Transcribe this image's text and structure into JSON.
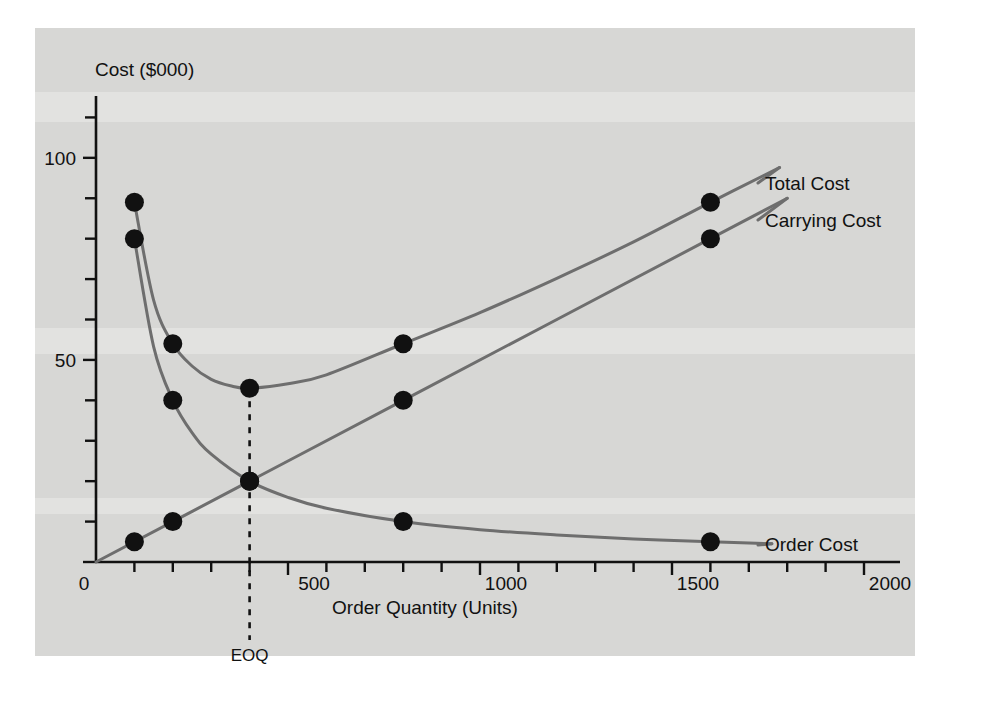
{
  "chart_data": {
    "type": "line",
    "title": "",
    "xlabel": "Order Quantity (Units)",
    "ylabel": "Cost ($000)",
    "xlim": [
      0,
      2000
    ],
    "ylim": [
      0,
      120
    ],
    "xticks": [
      0,
      100,
      200,
      300,
      400,
      500,
      600,
      700,
      800,
      900,
      1000,
      1100,
      1200,
      1300,
      1400,
      1500,
      1600,
      1700,
      1800,
      1900,
      2000
    ],
    "xtick_labels": [
      "0",
      "500",
      "1000",
      "1500",
      "2000"
    ],
    "xtick_label_values": [
      0,
      500,
      1000,
      1500,
      2000
    ],
    "yticks": [
      0,
      10,
      20,
      30,
      40,
      50,
      60,
      70,
      80,
      90,
      100,
      110
    ],
    "ytick_labels": [
      "0",
      "50",
      "100"
    ],
    "ytick_label_values": [
      0,
      50,
      100
    ],
    "grid": false,
    "legend_position": "right-of-curves",
    "annotations": [
      {
        "name": "eoq-marker",
        "label": "EOQ",
        "x": 400,
        "style": "dashed-vertical",
        "from_y": 0,
        "to_y": 43
      }
    ],
    "series": [
      {
        "name": "Total Cost",
        "label": "Total Cost",
        "color": "#6e6e6e",
        "marker": "filled-circle",
        "marker_points": [
          {
            "x": 100,
            "y": 89
          },
          {
            "x": 200,
            "y": 54
          },
          {
            "x": 400,
            "y": 43
          },
          {
            "x": 800,
            "y": 54
          },
          {
            "x": 1600,
            "y": 89
          }
        ],
        "curve": [
          {
            "x": 100,
            "y": 89
          },
          {
            "x": 150,
            "y": 64.8
          },
          {
            "x": 200,
            "y": 54
          },
          {
            "x": 250,
            "y": 48.5
          },
          {
            "x": 300,
            "y": 45.2
          },
          {
            "x": 350,
            "y": 43.6
          },
          {
            "x": 400,
            "y": 43
          },
          {
            "x": 500,
            "y": 44.1
          },
          {
            "x": 600,
            "y": 46.3
          },
          {
            "x": 800,
            "y": 54
          },
          {
            "x": 1000,
            "y": 61.7
          },
          {
            "x": 1200,
            "y": 70.2
          },
          {
            "x": 1400,
            "y": 79.2
          },
          {
            "x": 1600,
            "y": 89
          },
          {
            "x": 1780,
            "y": 97.6
          }
        ]
      },
      {
        "name": "Carrying Cost",
        "label": "Carrying Cost",
        "color": "#6e6e6e",
        "marker": "filled-circle",
        "marker_points": [
          {
            "x": 100,
            "y": 5
          },
          {
            "x": 200,
            "y": 10
          },
          {
            "x": 400,
            "y": 20
          },
          {
            "x": 800,
            "y": 40
          },
          {
            "x": 1600,
            "y": 80
          }
        ],
        "curve": [
          {
            "x": 0,
            "y": 0
          },
          {
            "x": 400,
            "y": 20
          },
          {
            "x": 800,
            "y": 40
          },
          {
            "x": 1600,
            "y": 80
          },
          {
            "x": 1800,
            "y": 90
          }
        ]
      },
      {
        "name": "Order Cost",
        "label": "Order Cost",
        "color": "#6e6e6e",
        "marker": "filled-circle",
        "marker_points": [
          {
            "x": 100,
            "y": 80
          },
          {
            "x": 200,
            "y": 40
          },
          {
            "x": 400,
            "y": 20
          },
          {
            "x": 800,
            "y": 10
          },
          {
            "x": 1600,
            "y": 5
          }
        ],
        "curve": [
          {
            "x": 100,
            "y": 80
          },
          {
            "x": 150,
            "y": 53.3
          },
          {
            "x": 200,
            "y": 40
          },
          {
            "x": 250,
            "y": 32
          },
          {
            "x": 300,
            "y": 26.7
          },
          {
            "x": 400,
            "y": 20
          },
          {
            "x": 500,
            "y": 16
          },
          {
            "x": 600,
            "y": 13.3
          },
          {
            "x": 800,
            "y": 10
          },
          {
            "x": 1000,
            "y": 8
          },
          {
            "x": 1200,
            "y": 6.7
          },
          {
            "x": 1400,
            "y": 5.7
          },
          {
            "x": 1600,
            "y": 5
          },
          {
            "x": 1760,
            "y": 4.5
          }
        ]
      }
    ]
  },
  "labels": {
    "y_axis_title": "Cost ($000)",
    "x_axis_title": "Order Quantity (Units)",
    "y_100": "100",
    "y_50": "50",
    "y_0": "0",
    "x_0": "0",
    "x_500": "500",
    "x_1000": "1000",
    "x_1500": "1500",
    "x_2000": "2000",
    "eoq": "EOQ",
    "total_cost": "Total Cost",
    "carrying_cost": "Carrying Cost",
    "order_cost": "Order Cost"
  },
  "colors": {
    "panel_background": "#d7d7d5",
    "page_background": "#ffffff",
    "curve": "#6e6e6e",
    "axis": "#111111",
    "marker": "#111111",
    "text": "#111111"
  }
}
